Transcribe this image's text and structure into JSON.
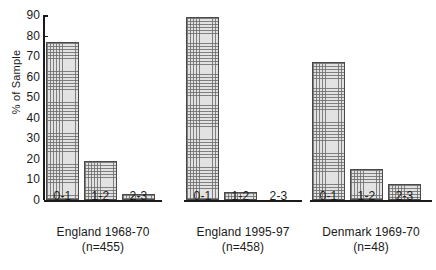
{
  "chart_data": {
    "type": "bar",
    "title": "",
    "xlabel": "",
    "ylabel": "% of Sample",
    "ylim": [
      0,
      90
    ],
    "ytick_step": 10,
    "yticks": [
      "90",
      "80",
      "70",
      "60",
      "50",
      "40",
      "30",
      "20",
      "10",
      "0"
    ],
    "grid": false,
    "legend": "none",
    "categories": [
      "0-1",
      "1-2",
      "2-3"
    ],
    "groups": [
      {
        "name": "England 1968-70",
        "caption": "England 1968-70",
        "n_label": "(n=455)",
        "categories": [
          "0-1",
          "1-2",
          "2-3"
        ],
        "values": [
          77,
          19,
          3
        ]
      },
      {
        "name": "England 1995-97",
        "caption": "England 1995-97",
        "n_label": "(n=458)",
        "categories": [
          "0-1",
          "1-2",
          "2-3"
        ],
        "values": [
          89,
          4,
          0
        ]
      },
      {
        "name": "Denmark 1969-70",
        "caption": "Denmark 1969-70",
        "n_label": "(n=48)",
        "categories": [
          "0-1",
          "1-2",
          "2-3"
        ],
        "values": [
          67,
          15,
          8
        ]
      }
    ]
  },
  "colors": {
    "axis": "#1a1a1a",
    "bar_fill": "#e2e2e2",
    "bar_edge": "#4a4a4a",
    "background": "#ffffff"
  }
}
